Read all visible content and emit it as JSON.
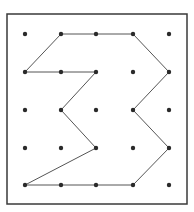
{
  "diagram": {
    "type": "dot-grid-polygon",
    "grid": {
      "cols": 5,
      "rows": 5
    },
    "colors": {
      "border": "#3a3a3a",
      "dot": "#2a2a2a",
      "line": "#555555",
      "background": "#ffffff"
    },
    "polygon_vertices": [
      [
        2,
        1
      ],
      [
        3,
        1
      ],
      [
        4,
        1
      ],
      [
        5,
        2
      ],
      [
        4,
        3
      ],
      [
        5,
        4
      ],
      [
        4,
        5
      ],
      [
        3,
        5
      ],
      [
        2,
        5
      ],
      [
        1,
        5
      ],
      [
        3,
        4
      ],
      [
        2,
        3
      ],
      [
        3,
        2
      ],
      [
        2,
        2
      ],
      [
        1,
        2
      ]
    ]
  }
}
